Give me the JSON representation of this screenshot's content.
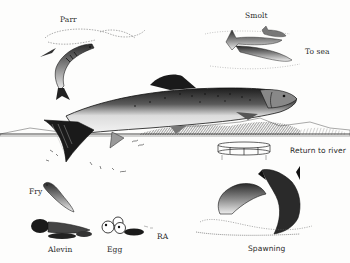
{
  "diagram": {
    "style": "black ink engraving illustration",
    "colors": {
      "ink": "#1a1a1a",
      "paper": "#fdfdfc",
      "shade": "#6a6a6a"
    },
    "stages": [
      {
        "id": "parr",
        "label": "Parr"
      },
      {
        "id": "smolt",
        "label": "Smolt"
      },
      {
        "id": "to_sea",
        "label": "To sea"
      },
      {
        "id": "return",
        "label": "Return to river"
      },
      {
        "id": "fry",
        "label": "Fry"
      },
      {
        "id": "alevin",
        "label": "Alevin"
      },
      {
        "id": "egg",
        "label": "Egg"
      },
      {
        "id": "spawning",
        "label": "Spawning"
      }
    ],
    "signature": "RA"
  }
}
